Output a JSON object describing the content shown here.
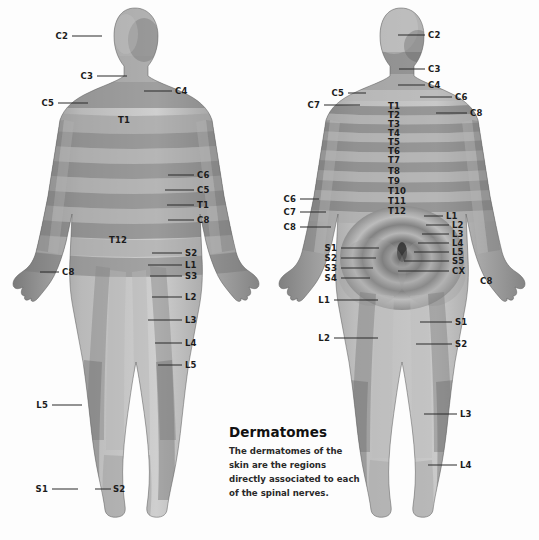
{
  "caption": {
    "title": "Dermatomes",
    "body": "The dermatomes of the skin are the regions directly associated to each of the spinal nerves."
  },
  "figures": {
    "anterior": {
      "name": "anterior-body-figure",
      "view": "front"
    },
    "posterior": {
      "name": "posterior-body-figure",
      "view": "back"
    }
  },
  "anterior_labels": [
    {
      "text": "C2",
      "x": 68,
      "y": 36,
      "align": "r",
      "lx": 72,
      "ly": 36,
      "lw": 30
    },
    {
      "text": "C3",
      "x": 93,
      "y": 76,
      "align": "r",
      "lx": 97,
      "ly": 76,
      "lw": 30
    },
    {
      "text": "C4",
      "x": 175,
      "y": 91,
      "align": "l",
      "lx": 144,
      "ly": 91,
      "lw": 28
    },
    {
      "text": "C5",
      "x": 54,
      "y": 103,
      "align": "r",
      "lx": 58,
      "ly": 103,
      "lw": 30
    },
    {
      "text": "T1",
      "x": 124,
      "y": 120,
      "align": "c",
      "lx": 0,
      "ly": 0,
      "lw": 0
    },
    {
      "text": "C6",
      "x": 197,
      "y": 175,
      "align": "l",
      "lx": 168,
      "ly": 175,
      "lw": 26
    },
    {
      "text": "C5",
      "x": 197,
      "y": 190,
      "align": "l",
      "lx": 165,
      "ly": 190,
      "lw": 29
    },
    {
      "text": "T1",
      "x": 197,
      "y": 205,
      "align": "l",
      "lx": 167,
      "ly": 205,
      "lw": 27
    },
    {
      "text": "C8",
      "x": 197,
      "y": 220,
      "align": "l",
      "lx": 168,
      "ly": 220,
      "lw": 26
    },
    {
      "text": "T12",
      "x": 118,
      "y": 240,
      "align": "c",
      "lx": 0,
      "ly": 0,
      "lw": 0
    },
    {
      "text": "C8",
      "x": 62,
      "y": 272,
      "align": "l",
      "lx": 40,
      "ly": 272,
      "lw": 19
    },
    {
      "text": "S2",
      "x": 185,
      "y": 253,
      "align": "l",
      "lx": 152,
      "ly": 253,
      "lw": 30
    },
    {
      "text": "L1",
      "x": 185,
      "y": 265,
      "align": "l",
      "lx": 148,
      "ly": 265,
      "lw": 34
    },
    {
      "text": "S3",
      "x": 185,
      "y": 276,
      "align": "l",
      "lx": 150,
      "ly": 276,
      "lw": 32
    },
    {
      "text": "L2",
      "x": 185,
      "y": 297,
      "align": "l",
      "lx": 152,
      "ly": 297,
      "lw": 30
    },
    {
      "text": "L3",
      "x": 185,
      "y": 320,
      "align": "l",
      "lx": 148,
      "ly": 320,
      "lw": 34
    },
    {
      "text": "L4",
      "x": 185,
      "y": 343,
      "align": "l",
      "lx": 155,
      "ly": 343,
      "lw": 27
    },
    {
      "text": "L5",
      "x": 185,
      "y": 365,
      "align": "l",
      "lx": 158,
      "ly": 365,
      "lw": 24
    },
    {
      "text": "L5",
      "x": 48,
      "y": 405,
      "align": "r",
      "lx": 52,
      "ly": 405,
      "lw": 30
    },
    {
      "text": "S1",
      "x": 48,
      "y": 489,
      "align": "r",
      "lx": 52,
      "ly": 489,
      "lw": 26
    },
    {
      "text": "S2",
      "x": 113,
      "y": 489,
      "align": "l",
      "lx": 95,
      "ly": 489,
      "lw": 16
    }
  ],
  "posterior_labels": [
    {
      "text": "C2",
      "x": 428,
      "y": 35,
      "align": "l",
      "lx": 398,
      "ly": 35,
      "lw": 27
    },
    {
      "text": "C3",
      "x": 428,
      "y": 69,
      "align": "l",
      "lx": 399,
      "ly": 69,
      "lw": 26
    },
    {
      "text": "C4",
      "x": 428,
      "y": 85,
      "align": "l",
      "lx": 398,
      "ly": 85,
      "lw": 27
    },
    {
      "text": "C5",
      "x": 344,
      "y": 93,
      "align": "r",
      "lx": 348,
      "ly": 93,
      "lw": 18
    },
    {
      "text": "C6",
      "x": 455,
      "y": 97,
      "align": "l",
      "lx": 420,
      "ly": 97,
      "lw": 32
    },
    {
      "text": "C7",
      "x": 320,
      "y": 105,
      "align": "r",
      "lx": 324,
      "ly": 105,
      "lw": 36
    },
    {
      "text": "C8",
      "x": 470,
      "y": 113,
      "align": "l",
      "lx": 436,
      "ly": 113,
      "lw": 31
    },
    {
      "text": "T1",
      "x": 388,
      "y": 106,
      "align": "l",
      "lx": 0,
      "ly": 0,
      "lw": 0
    },
    {
      "text": "T2",
      "x": 388,
      "y": 115,
      "align": "l",
      "lx": 0,
      "ly": 0,
      "lw": 0
    },
    {
      "text": "T3",
      "x": 388,
      "y": 124,
      "align": "l",
      "lx": 0,
      "ly": 0,
      "lw": 0
    },
    {
      "text": "T4",
      "x": 388,
      "y": 133,
      "align": "l",
      "lx": 0,
      "ly": 0,
      "lw": 0
    },
    {
      "text": "T5",
      "x": 388,
      "y": 142,
      "align": "l",
      "lx": 0,
      "ly": 0,
      "lw": 0
    },
    {
      "text": "T6",
      "x": 388,
      "y": 151,
      "align": "l",
      "lx": 0,
      "ly": 0,
      "lw": 0
    },
    {
      "text": "T7",
      "x": 388,
      "y": 160,
      "align": "l",
      "lx": 0,
      "ly": 0,
      "lw": 0
    },
    {
      "text": "T8",
      "x": 388,
      "y": 171,
      "align": "l",
      "lx": 0,
      "ly": 0,
      "lw": 0
    },
    {
      "text": "T9",
      "x": 388,
      "y": 181,
      "align": "l",
      "lx": 0,
      "ly": 0,
      "lw": 0
    },
    {
      "text": "T10",
      "x": 388,
      "y": 191,
      "align": "l",
      "lx": 0,
      "ly": 0,
      "lw": 0
    },
    {
      "text": "T11",
      "x": 388,
      "y": 201,
      "align": "l",
      "lx": 0,
      "ly": 0,
      "lw": 0
    },
    {
      "text": "T12",
      "x": 388,
      "y": 211,
      "align": "l",
      "lx": 0,
      "ly": 0,
      "lw": 0
    },
    {
      "text": "C6",
      "x": 296,
      "y": 199,
      "align": "r",
      "lx": 300,
      "ly": 199,
      "lw": 19
    },
    {
      "text": "C7",
      "x": 296,
      "y": 212,
      "align": "r",
      "lx": 300,
      "ly": 212,
      "lw": 26
    },
    {
      "text": "C8",
      "x": 296,
      "y": 227,
      "align": "r",
      "lx": 300,
      "ly": 227,
      "lw": 31
    },
    {
      "text": "L1",
      "x": 446,
      "y": 216,
      "align": "l",
      "lx": 424,
      "ly": 216,
      "lw": 19
    },
    {
      "text": "L2",
      "x": 452,
      "y": 225,
      "align": "l",
      "lx": 426,
      "ly": 225,
      "lw": 23
    },
    {
      "text": "L3",
      "x": 452,
      "y": 234,
      "align": "l",
      "lx": 422,
      "ly": 234,
      "lw": 27
    },
    {
      "text": "L4",
      "x": 452,
      "y": 243,
      "align": "l",
      "lx": 418,
      "ly": 243,
      "lw": 31
    },
    {
      "text": "L5",
      "x": 452,
      "y": 252,
      "align": "l",
      "lx": 414,
      "ly": 252,
      "lw": 35
    },
    {
      "text": "S5",
      "x": 452,
      "y": 261,
      "align": "l",
      "lx": 404,
      "ly": 261,
      "lw": 45
    },
    {
      "text": "CX",
      "x": 452,
      "y": 271,
      "align": "l",
      "lx": 398,
      "ly": 271,
      "lw": 51
    },
    {
      "text": "C8",
      "x": 480,
      "y": 281,
      "align": "l",
      "lx": 0,
      "ly": 0,
      "lw": 0
    },
    {
      "text": "S1",
      "x": 337,
      "y": 248,
      "align": "r",
      "lx": 341,
      "ly": 248,
      "lw": 38
    },
    {
      "text": "S2",
      "x": 337,
      "y": 258,
      "align": "r",
      "lx": 341,
      "ly": 258,
      "lw": 35
    },
    {
      "text": "S3",
      "x": 337,
      "y": 268,
      "align": "r",
      "lx": 341,
      "ly": 268,
      "lw": 32
    },
    {
      "text": "S4",
      "x": 337,
      "y": 278,
      "align": "r",
      "lx": 341,
      "ly": 278,
      "lw": 29
    },
    {
      "text": "L1",
      "x": 330,
      "y": 300,
      "align": "r",
      "lx": 334,
      "ly": 300,
      "lw": 44
    },
    {
      "text": "L2",
      "x": 330,
      "y": 338,
      "align": "r",
      "lx": 334,
      "ly": 338,
      "lw": 44
    },
    {
      "text": "S1",
      "x": 455,
      "y": 322,
      "align": "l",
      "lx": 420,
      "ly": 322,
      "lw": 32
    },
    {
      "text": "S2",
      "x": 455,
      "y": 344,
      "align": "l",
      "lx": 416,
      "ly": 344,
      "lw": 36
    },
    {
      "text": "L3",
      "x": 460,
      "y": 414,
      "align": "l",
      "lx": 424,
      "ly": 414,
      "lw": 33
    },
    {
      "text": "L4",
      "x": 460,
      "y": 465,
      "align": "l",
      "lx": 428,
      "ly": 465,
      "lw": 29
    }
  ]
}
